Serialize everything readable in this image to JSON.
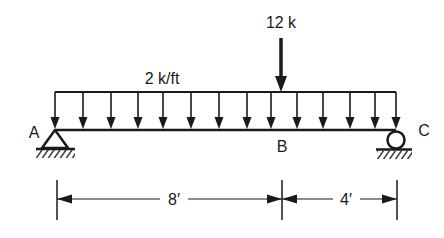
{
  "diagram": {
    "type": "beam-loading",
    "colors": {
      "ink": "#1a1a1a",
      "background": "#ffffff"
    },
    "labels": {
      "distributed_load": "2 k/ft",
      "point_load": "12 k",
      "support_a": "A",
      "point_b": "B",
      "support_c": "C",
      "span_ab": "8′",
      "span_bc": "4′"
    },
    "beam": {
      "x_start": 55,
      "x_end": 396,
      "y": 130
    },
    "distributed_load": {
      "top_y": 92,
      "arrow_x": [
        55,
        83,
        111,
        138,
        163,
        191,
        219,
        247,
        271,
        297,
        323,
        350,
        375,
        396
      ]
    },
    "point_load": {
      "x": 281,
      "top_y": 38,
      "bottom_y": 92
    },
    "supports": [
      {
        "id": "A",
        "kind": "pin",
        "x": 55
      },
      {
        "id": "C",
        "kind": "roller",
        "x": 396
      }
    ],
    "dimensions": {
      "y": 199,
      "ticks_x": [
        57,
        282,
        397
      ],
      "segments": [
        {
          "label": "8′",
          "from": 57,
          "to": 282,
          "label_x": 174
        },
        {
          "label": "4′",
          "from": 282,
          "to": 397,
          "label_x": 346
        }
      ]
    }
  }
}
